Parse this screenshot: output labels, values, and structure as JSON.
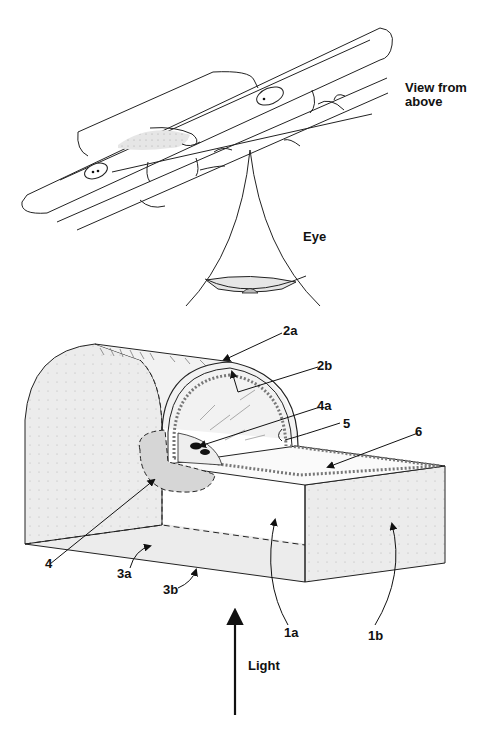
{
  "top_view": {
    "title_line1": "View from",
    "title_line2": "above",
    "eye_label": "Eye"
  },
  "block_view": {
    "labels": {
      "l2a": "2a",
      "l2b": "2b",
      "l4a": "4a",
      "l5": "5",
      "l6": "6",
      "l4": "4",
      "l3a": "3a",
      "l3b": "3b",
      "l1a": "1a",
      "l1b": "1b"
    },
    "light_label": "Light"
  },
  "colors": {
    "stroke": "#222222",
    "stipple_fill": "#e4e4e4",
    "dark_fill": "#c8c8c8",
    "background": "#ffffff"
  }
}
